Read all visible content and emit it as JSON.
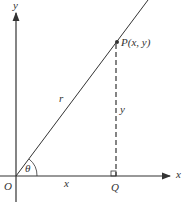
{
  "diagram": {
    "axes": {
      "x_label": "x",
      "y_label": "y",
      "origin_label": "O"
    },
    "point": {
      "label": "P(x, y)"
    },
    "foot": {
      "label": "Q"
    },
    "segments": {
      "hypotenuse_label": "r",
      "horizontal_label": "x",
      "vertical_label": "y"
    },
    "angle": {
      "label": "θ"
    },
    "colors": {
      "line": "#333333",
      "background": "#ffffff"
    }
  }
}
